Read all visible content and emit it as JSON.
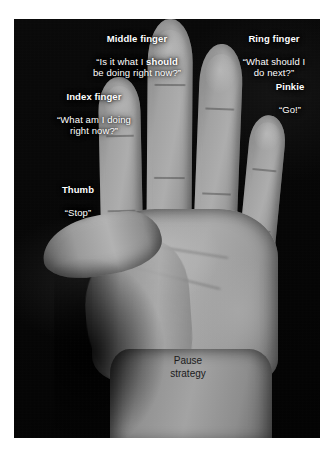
{
  "figure": {
    "alt_description": "Photograph of an open right hand on a black background with white annotation labels pointing to each finger, illustrating a pause strategy",
    "background_color": "#ffffff",
    "photo_background_color": "#070707",
    "label_text_color": "#ffffff",
    "palm_text_color": "#1b1b1b"
  },
  "labels": {
    "middle_finger": {
      "title": "Middle finger",
      "quote_before": "“Is it what I ",
      "quote_bold": "should",
      "quote_after": "\nbe doing right now?”"
    },
    "ring_finger": {
      "title": "Ring finger",
      "quote": "“What should I\ndo next?”"
    },
    "pinkie": {
      "title": "Pinkie",
      "quote": "“Go!”"
    },
    "index_finger": {
      "title": "Index finger",
      "quote": "“What am I doing\nright now?”"
    },
    "thumb": {
      "title": "Thumb",
      "quote": "“Stop”"
    },
    "palm": {
      "text": "Pause\nstrategy"
    }
  }
}
